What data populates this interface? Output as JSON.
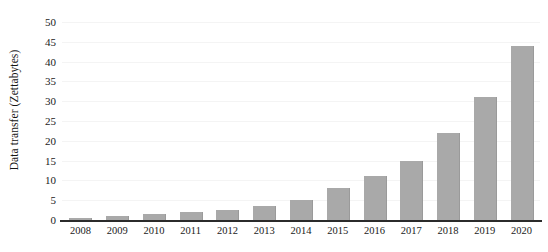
{
  "chart_data": {
    "type": "bar",
    "title": "",
    "xlabel": "",
    "ylabel": "Data transfer (Zettabytes)",
    "categories": [
      "2008",
      "2009",
      "2010",
      "2011",
      "2012",
      "2013",
      "2014",
      "2015",
      "2016",
      "2017",
      "2018",
      "2019",
      "2020"
    ],
    "values": [
      0.5,
      1,
      1.5,
      2,
      2.5,
      3.5,
      5,
      8,
      11,
      15,
      22,
      31,
      44
    ],
    "ylim": [
      0,
      50
    ],
    "yticks": [
      0,
      5,
      10,
      15,
      20,
      25,
      30,
      35,
      40,
      45,
      50
    ],
    "ytick_labels": [
      "0",
      "5",
      "10",
      "15",
      "20",
      "25",
      "30",
      "35",
      "40",
      "45",
      "50"
    ],
    "grid": true,
    "legend": null,
    "series_color": "#a9a9a9",
    "axis_color": "#2b2b2b"
  }
}
